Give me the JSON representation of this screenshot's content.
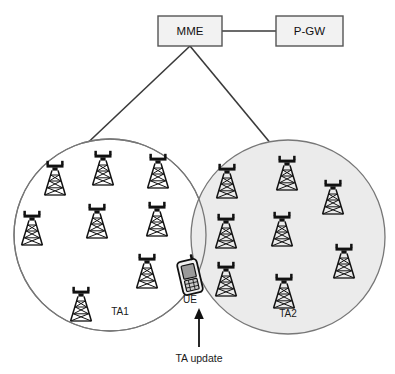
{
  "diagram": {
    "colors": {
      "stroke": "#3a3a3a",
      "box_fill": "#f2f2f2",
      "box_stroke": "#555555",
      "circle_stroke": "#777777",
      "ta1_fill": "#ffffff",
      "ta2_fill": "#ebebeb",
      "tower_stroke": "#111111",
      "text": "#1a1a1a",
      "background": "#ffffff"
    },
    "nodes": [
      {
        "id": "mme",
        "label": "MME",
        "shape": "rectangle",
        "x": 158,
        "y": 16,
        "width": 64,
        "height": 30
      },
      {
        "id": "pgw",
        "label": "P-GW",
        "shape": "rectangle",
        "x": 276,
        "y": 16,
        "width": 67,
        "height": 30
      }
    ],
    "links": [
      {
        "id": "mme-pgw",
        "from": "mme",
        "to": "pgw",
        "kind": "straight"
      },
      {
        "id": "mme-ta1",
        "from": "mme",
        "to": "ta1",
        "kind": "diagonal"
      },
      {
        "id": "mme-ta2",
        "from": "mme",
        "to": "ta2",
        "kind": "diagonal"
      }
    ],
    "tracking_areas": [
      {
        "id": "ta1",
        "label": "TA1",
        "cx": 110,
        "cy": 235,
        "r": 96,
        "shaded": false,
        "label_x": 120,
        "label_y": 315,
        "tower_count": 8,
        "towers": [
          {
            "x": 55,
            "y": 162
          },
          {
            "x": 103,
            "y": 152
          },
          {
            "x": 158,
            "y": 155
          },
          {
            "x": 32,
            "y": 212
          },
          {
            "x": 97,
            "y": 205
          },
          {
            "x": 157,
            "y": 203
          },
          {
            "x": 147,
            "y": 255
          },
          {
            "x": 81,
            "y": 288
          }
        ]
      },
      {
        "id": "ta2",
        "label": "TA2",
        "cx": 288,
        "cy": 237,
        "r": 97,
        "shaded": true,
        "label_x": 288,
        "label_y": 317,
        "tower_count": 8,
        "towers": [
          {
            "x": 227,
            "y": 165
          },
          {
            "x": 287,
            "y": 157
          },
          {
            "x": 333,
            "y": 181
          },
          {
            "x": 226,
            "y": 215
          },
          {
            "x": 282,
            "y": 213
          },
          {
            "x": 344,
            "y": 245
          },
          {
            "x": 226,
            "y": 263
          },
          {
            "x": 284,
            "y": 275
          }
        ]
      }
    ],
    "ue": {
      "id": "ue",
      "label": "UE",
      "x": 180,
      "y": 259,
      "width": 22,
      "height": 34,
      "label_x": 190,
      "label_y": 303
    },
    "annotation": {
      "id": "ta-update",
      "label": "TA update",
      "label_x": 199,
      "label_y": 358,
      "arrow": {
        "x": 199,
        "y_tail": 347,
        "y_head": 310
      }
    }
  }
}
